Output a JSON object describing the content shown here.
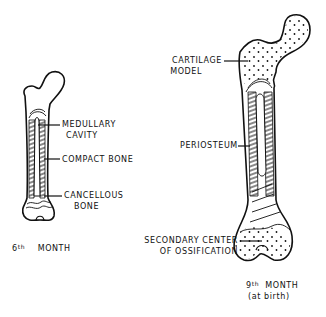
{
  "figure": {
    "stages": [
      {
        "id": "sixth-month",
        "caption_number": "6",
        "caption_suffix": "th",
        "caption_text": "MONTH",
        "labels": [
          {
            "line1": "MEDULLARY",
            "line2": "CAVITY"
          },
          {
            "line1": "COMPACT BONE",
            "line2": ""
          },
          {
            "line1": "CANCELLOUS",
            "line2": "BONE"
          }
        ]
      },
      {
        "id": "ninth-month",
        "caption_number": "9",
        "caption_suffix": "th",
        "caption_text": "MONTH",
        "caption_sub": "(at birth)",
        "labels": [
          {
            "line1": "CARTILAGE",
            "line2": "MODEL"
          },
          {
            "line1": "PERIOSTEUM",
            "line2": ""
          },
          {
            "line1": "SECONDARY CENTER",
            "line2": "OF OSSIFICATION"
          }
        ]
      }
    ],
    "colors": {
      "ink": "#111111",
      "background": "#ffffff"
    }
  }
}
